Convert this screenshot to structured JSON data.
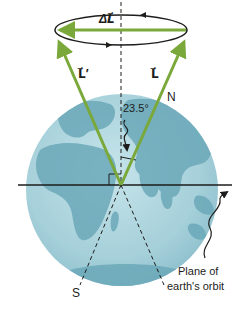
{
  "diagram": {
    "type": "precession-of-earth",
    "labels": {
      "delta_L": "ΔL⃗",
      "L_prime": "L⃗′",
      "L": "L⃗",
      "north": "N",
      "south": "S",
      "angle": "23.5°",
      "plane_line1": "Plane of",
      "plane_line2": "earth's orbit"
    },
    "colors": {
      "vector_green": "#7aa83a",
      "earth_ocean": "#a9d3dd",
      "earth_land": "#6aa7b8",
      "line": "#1d1d1b"
    }
  }
}
